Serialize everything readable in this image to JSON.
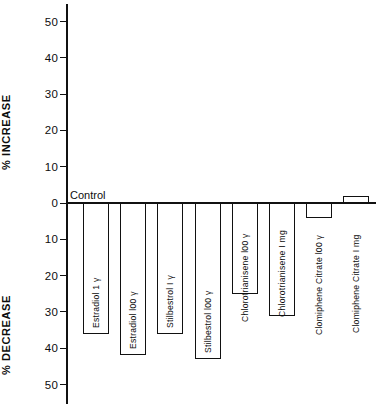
{
  "chart_data": {
    "type": "bar",
    "title": "",
    "subtitle": "",
    "xlabel": "",
    "ylabel": "% INCREASE / % DECREASE",
    "ylim": [
      -50,
      50
    ],
    "y_axis_upper_label": "% INCREASE",
    "y_axis_lower_label": "% DECREASE",
    "grid": false,
    "legend": "none",
    "orientation": "vertical",
    "baseline_annotation": "Control",
    "y_ticks_increase": [
      "50",
      "40",
      "30",
      "20",
      "10"
    ],
    "y_tick_zero": "0",
    "y_ticks_decrease": [
      "10",
      "20",
      "30",
      "40",
      "50"
    ],
    "categories": [
      "Estradiol  1 γ",
      "Estradiol  l00 γ",
      "Stilbestrol  I γ",
      "Stilbestrol  l00 γ",
      "Chlorotrianisene  l00 γ",
      "Chlorotrianisene  I mg",
      "Clomiphene  Citrate  l00 γ",
      "Clomiphene  Citrate  I mg"
    ],
    "values": [
      -36,
      -42,
      -36,
      -43,
      -25,
      -31,
      -4,
      2
    ],
    "units": "percent change"
  },
  "axis": {
    "increase_title": "% INCREASE",
    "decrease_title": "% DECREASE",
    "control_label": "Control"
  },
  "ticks": [
    {
      "label": "50",
      "value": 50
    },
    {
      "label": "40",
      "value": 40
    },
    {
      "label": "30",
      "value": 30
    },
    {
      "label": "20",
      "value": 20
    },
    {
      "label": "10",
      "value": 10
    },
    {
      "label": "0",
      "value": 0
    },
    {
      "label": "10",
      "value": -10
    },
    {
      "label": "20",
      "value": -20
    },
    {
      "label": "30",
      "value": -30
    },
    {
      "label": "40",
      "value": -40
    },
    {
      "label": "50",
      "value": -50
    }
  ],
  "bars": [
    {
      "label": "Estradiol  1 γ",
      "value": -36
    },
    {
      "label": "Estradiol  l00 γ",
      "value": -42
    },
    {
      "label": "Stilbestrol  I γ",
      "value": -36
    },
    {
      "label": "Stilbestrol  l00 γ",
      "value": -43
    },
    {
      "label": "Chlorotrianisene  l00 γ",
      "value": -25
    },
    {
      "label": "Chlorotrianisene  I mg",
      "value": -31
    },
    {
      "label": "Clomiphene  Citrate  l00 γ",
      "value": -4
    },
    {
      "label": "Clomiphene  Citrate  I mg",
      "value": 2
    }
  ]
}
